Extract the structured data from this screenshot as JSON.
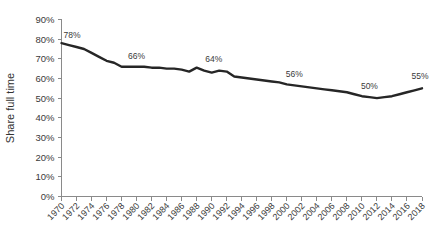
{
  "chart_data": {
    "type": "line",
    "title": "",
    "xlabel": "",
    "ylabel": "Share full time",
    "ylim": [
      0,
      90
    ],
    "xlim": [
      1970,
      2018
    ],
    "grid": false,
    "legend": null,
    "ytick_labels": [
      "90%",
      "80%",
      "70%",
      "60%",
      "50%",
      "40%",
      "30%",
      "20%",
      "10%",
      "0%"
    ],
    "ytick_values": [
      90,
      80,
      70,
      60,
      50,
      40,
      30,
      20,
      10,
      0
    ],
    "xtick_labels": [
      "1970",
      "1972",
      "1974",
      "1976",
      "1978",
      "1980",
      "1982",
      "1984",
      "1986",
      "1988",
      "1990",
      "1992",
      "1994",
      "1996",
      "1998",
      "2000",
      "2002",
      "2004",
      "2006",
      "2008",
      "2010",
      "2012",
      "2014",
      "2016",
      "2018"
    ],
    "x": [
      1970,
      1971,
      1972,
      1973,
      1974,
      1975,
      1976,
      1977,
      1978,
      1979,
      1980,
      1981,
      1982,
      1983,
      1984,
      1985,
      1986,
      1987,
      1988,
      1989,
      1990,
      1991,
      1992,
      1993,
      1994,
      1995,
      1996,
      1997,
      1998,
      1999,
      2000,
      2001,
      2002,
      2003,
      2004,
      2005,
      2006,
      2007,
      2008,
      2009,
      2010,
      2011,
      2012,
      2013,
      2014,
      2015,
      2016,
      2017,
      2018
    ],
    "series": [
      {
        "name": "Share full time",
        "values": [
          78,
          77,
          76,
          75,
          73,
          71,
          69,
          68,
          66,
          66,
          66,
          66,
          65.5,
          65.5,
          65,
          65,
          64.5,
          63.5,
          65.5,
          64,
          63,
          64,
          63.5,
          61,
          60.5,
          60,
          59.5,
          59,
          58.5,
          58,
          57,
          56.5,
          56,
          55.5,
          55,
          54.5,
          54,
          53.5,
          53,
          52,
          51,
          50.5,
          50,
          50.5,
          51,
          52,
          53,
          54,
          55
        ]
      }
    ],
    "annotations": [
      {
        "label": "78%",
        "x": 1970,
        "y": 78
      },
      {
        "label": "66%",
        "x": 1980,
        "y": 66
      },
      {
        "label": "64%",
        "x": 1990,
        "y": 64
      },
      {
        "label": "56%",
        "x": 2001,
        "y": 56.5
      },
      {
        "label": "50%",
        "x": 2011,
        "y": 50.5
      },
      {
        "label": "55%",
        "x": 2018,
        "y": 55
      }
    ],
    "line_color": "#262626",
    "axis_color": "#8a8a8a",
    "text_color": "#3a3a3a"
  }
}
